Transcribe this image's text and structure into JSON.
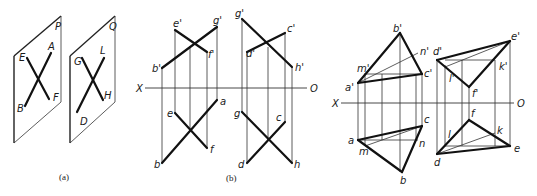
{
  "figure_a": {
    "caption": "(a)",
    "planes": [
      {
        "name": "P",
        "corner_label": "P",
        "points": {
          "E": "E",
          "A": "A",
          "B": "B",
          "F": "F"
        }
      },
      {
        "name": "Q",
        "corner_label": "Q",
        "points": {
          "G": "G",
          "L": "L",
          "D": "D",
          "H": "H"
        }
      }
    ]
  },
  "figure_b": {
    "caption": "(b)",
    "axis": {
      "left": "X",
      "right": "O"
    },
    "left_pair": {
      "front": {
        "b": "b'",
        "e": "e'",
        "g": "g'",
        "f": "f'"
      },
      "top": {
        "b": "b",
        "e": "e",
        "a": "a",
        "f": "f"
      }
    },
    "right_pair": {
      "front": {
        "g": "g'",
        "c": "c'",
        "d": "d'",
        "h": "h'"
      },
      "top": {
        "g": "g",
        "c": "c",
        "d": "d",
        "h": "h"
      }
    }
  },
  "figure_c": {
    "axis": {
      "left": "X",
      "right": "O"
    },
    "triangle_abc": {
      "front": {
        "b": "b'",
        "n": "n'",
        "m": "m'",
        "c": "c'",
        "a": "a'"
      },
      "top": {
        "a": "a",
        "m": "m",
        "c": "c",
        "n": "n",
        "b": "b"
      }
    },
    "triangle_def": {
      "front": {
        "d": "d'",
        "e": "e'",
        "k": "k'",
        "l": "l'",
        "f": "f'"
      },
      "top": {
        "f": "f",
        "l": "l",
        "k": "k",
        "d": "d",
        "e": "e"
      }
    }
  },
  "colors": {
    "ink": "#111111",
    "background": "#ffffff"
  }
}
